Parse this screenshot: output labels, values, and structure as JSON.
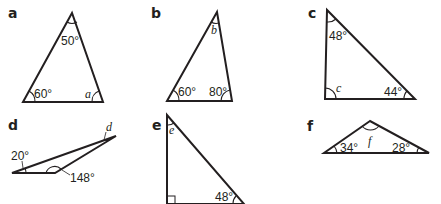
{
  "figure": {
    "stroke_color": "#231f20",
    "background": "#ffffff",
    "triangles": [
      {
        "part_label": "a",
        "angles": [
          {
            "vertex": "top",
            "label": "50°"
          },
          {
            "vertex": "bottom-left",
            "label": "60°"
          },
          {
            "vertex": "bottom-right",
            "label": "a",
            "unknown": true
          }
        ]
      },
      {
        "part_label": "b",
        "angles": [
          {
            "vertex": "top",
            "label": "b",
            "unknown": true
          },
          {
            "vertex": "bottom-left",
            "label": "60°"
          },
          {
            "vertex": "bottom-right",
            "label": "80°"
          }
        ]
      },
      {
        "part_label": "c",
        "angles": [
          {
            "vertex": "top",
            "label": "48°"
          },
          {
            "vertex": "bottom-left",
            "label": "c",
            "unknown": true
          },
          {
            "vertex": "bottom-right",
            "label": "44°"
          }
        ]
      },
      {
        "part_label": "d",
        "angles": [
          {
            "vertex": "left",
            "label": "20°"
          },
          {
            "vertex": "bottom-middle",
            "label": "148°"
          },
          {
            "vertex": "right",
            "label": "d",
            "unknown": true
          }
        ]
      },
      {
        "part_label": "e",
        "angles": [
          {
            "vertex": "top",
            "label": "e",
            "unknown": true
          },
          {
            "vertex": "bottom-left",
            "label": "90° (right angle)"
          },
          {
            "vertex": "bottom-right",
            "label": "48°"
          }
        ]
      },
      {
        "part_label": "f",
        "angles": [
          {
            "vertex": "top",
            "label": "f",
            "unknown": true
          },
          {
            "vertex": "bottom-left",
            "label": "34°"
          },
          {
            "vertex": "bottom-right",
            "label": "28°"
          }
        ]
      }
    ]
  }
}
